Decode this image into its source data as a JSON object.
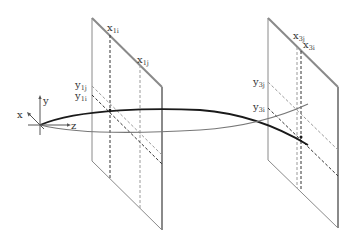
{
  "diagram": {
    "type": "3d-ray-projection",
    "axes": {
      "x_label": "x",
      "y_label": "y",
      "z_label": "z"
    },
    "panels": [
      {
        "id": "plane-1",
        "labels": {
          "x_i": {
            "base": "x",
            "sub": "1i"
          },
          "x_j": {
            "base": "x",
            "sub": "1j"
          },
          "y_j": {
            "base": "y",
            "sub": "1j"
          },
          "y_i": {
            "base": "y",
            "sub": "1i"
          }
        }
      },
      {
        "id": "plane-3",
        "labels": {
          "x_j": {
            "base": "x",
            "sub": "3j"
          },
          "x_i": {
            "base": "x",
            "sub": "3i"
          },
          "y_j": {
            "base": "y",
            "sub": "3j"
          },
          "y_i": {
            "base": "y",
            "sub": "3i"
          }
        }
      }
    ],
    "colors": {
      "ray_i": "#1a1a1a",
      "ray_j": "#777777",
      "frame": "#8a8a8a",
      "dashed_i": "#333333",
      "dashed_j": "#9a9a9a"
    }
  }
}
